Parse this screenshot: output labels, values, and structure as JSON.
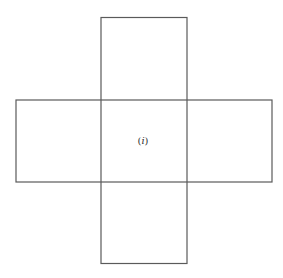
{
  "diagram": {
    "type": "cube-net-cross",
    "center_label": {
      "open": "(",
      "var": "i",
      "close": ")"
    },
    "stroke_color": "#555555",
    "background": "#ffffff"
  }
}
